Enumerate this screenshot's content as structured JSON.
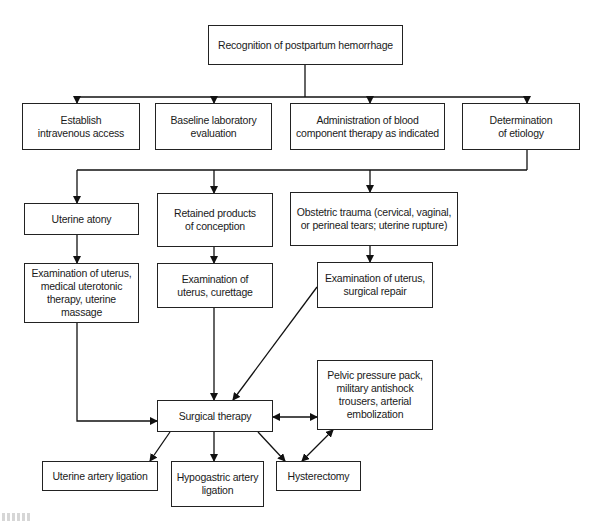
{
  "diagram": {
    "nodes": {
      "recognition": "Recognition of postpartum hemorrhage",
      "iv_access": "Establish\nintravenous access",
      "lab_eval": "Baseline laboratory\nevaluation",
      "blood_therapy": "Administration of blood\ncomponent therapy as indicated",
      "etiology": "Determination\nof etiology",
      "atony": "Uterine atony",
      "retained": "Retained products\nof conception",
      "trauma": "Obstetric trauma (cervical, vaginal,\nor perineal tears; uterine rupture)",
      "atony_tx": "Examination of uterus,\nmedical uterotonic\ntherapy, uterine massage",
      "retained_tx": "Examination of\nuterus, curettage",
      "trauma_tx": "Examination of uterus,\nsurgical repair",
      "pelvic": "Pelvic pressure pack,\nmilitary antishock\ntrousers, arterial\nembolization",
      "surgical": "Surgical therapy",
      "uterine_ligation": "Uterine artery ligation",
      "hypogastric_ligation": "Hypogastric artery\nligation",
      "hysterectomy": "Hysterectomy"
    },
    "edges": [
      {
        "from": "recognition",
        "to": "iv_access"
      },
      {
        "from": "recognition",
        "to": "lab_eval"
      },
      {
        "from": "recognition",
        "to": "blood_therapy"
      },
      {
        "from": "recognition",
        "to": "etiology"
      },
      {
        "from": "etiology",
        "to": "atony"
      },
      {
        "from": "etiology",
        "to": "retained"
      },
      {
        "from": "etiology",
        "to": "trauma"
      },
      {
        "from": "atony",
        "to": "atony_tx"
      },
      {
        "from": "retained",
        "to": "retained_tx"
      },
      {
        "from": "trauma",
        "to": "trauma_tx"
      },
      {
        "from": "atony_tx",
        "to": "surgical"
      },
      {
        "from": "retained_tx",
        "to": "surgical"
      },
      {
        "from": "trauma_tx",
        "to": "surgical"
      },
      {
        "from": "surgical",
        "to": "pelvic",
        "bidirectional": true
      },
      {
        "from": "surgical",
        "to": "uterine_ligation"
      },
      {
        "from": "surgical",
        "to": "hypogastric_ligation"
      },
      {
        "from": "surgical",
        "to": "hysterectomy"
      },
      {
        "from": "hysterectomy",
        "to": "pelvic",
        "bidirectional": true
      }
    ]
  }
}
